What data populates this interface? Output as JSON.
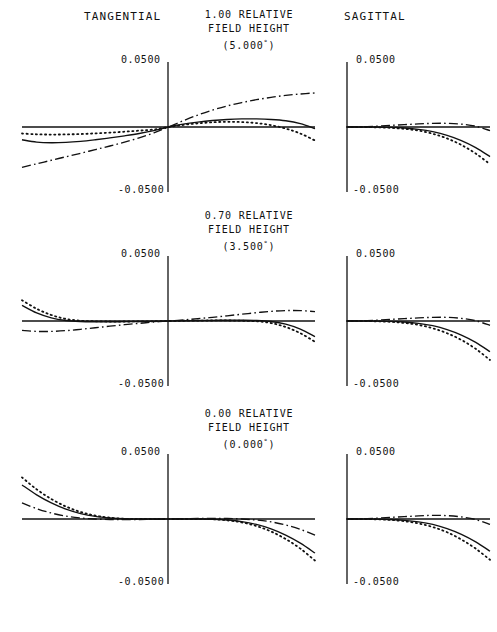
{
  "page": {
    "width": 497,
    "height": 632,
    "background": "#ffffff",
    "ink": "#111111"
  },
  "columns": {
    "tangential_label": "TANGENTIAL",
    "sagittal_label": "SAGITTAL"
  },
  "rows": [
    {
      "id": "row-1p00",
      "relative_field": "1.00 RELATIVE",
      "field_height_label": "FIELD HEIGHT",
      "angle": "(5.000",
      "angle_unit": "°",
      "angle_close": ")",
      "top_tick": "0.0500",
      "bottom_tick": "-0.0500"
    },
    {
      "id": "row-0p70",
      "relative_field": "0.70 RELATIVE",
      "field_height_label": "FIELD HEIGHT",
      "angle": "(3.500",
      "angle_unit": "°",
      "angle_close": ")",
      "top_tick": "0.0500",
      "bottom_tick": "-0.0500"
    },
    {
      "id": "row-0p00",
      "relative_field": "0.00 RELATIVE",
      "field_height_label": "FIELD HEIGHT",
      "angle": "(0.000",
      "angle_unit": "°",
      "angle_close": ")",
      "top_tick": "0.0500",
      "bottom_tick": "-0.0500"
    }
  ],
  "chart_data": {
    "type": "line",
    "xlabel": "Normalized pupil coordinate",
    "ylabel": "Transverse ray aberration (mm)",
    "ylim": [
      -0.05,
      0.05
    ],
    "ytick_labels": [
      "0.0500",
      "-0.0500"
    ],
    "grid": false,
    "legend_position": "none",
    "line_styles": {
      "solid": "wavelength-1",
      "dotted": "wavelength-2",
      "dashdot": "wavelength-3"
    },
    "panels": [
      {
        "panel": "tangential-1.00",
        "field": "1.00 RELATIVE FIELD HEIGHT (5.000°)",
        "fan": "tangential",
        "xlim": [
          -1,
          1
        ],
        "x": [
          -1.0,
          -0.9,
          -0.8,
          -0.7,
          -0.6,
          -0.5,
          -0.4,
          -0.3,
          -0.2,
          -0.1,
          0.0,
          0.1,
          0.2,
          0.3,
          0.4,
          0.5,
          0.6,
          0.7,
          0.8,
          0.9,
          1.0
        ],
        "series": [
          {
            "name": "wavelength-1",
            "style": "solid",
            "values": [
              -0.0098,
              -0.0116,
              -0.0121,
              -0.0118,
              -0.011,
              -0.0098,
              -0.0084,
              -0.0068,
              -0.005,
              -0.0028,
              0.0,
              0.0022,
              0.0038,
              0.005,
              0.0058,
              0.0062,
              0.0062,
              0.0058,
              0.0048,
              0.0026,
              -0.0012
            ]
          },
          {
            "name": "wavelength-2",
            "style": "dotted",
            "values": [
              -0.005,
              -0.0056,
              -0.0058,
              -0.0057,
              -0.0054,
              -0.0049,
              -0.0043,
              -0.0036,
              -0.0028,
              -0.0019,
              0.0,
              0.0016,
              0.0028,
              0.0036,
              0.004,
              0.0038,
              0.003,
              0.0014,
              -0.0012,
              -0.005,
              -0.0104
            ]
          },
          {
            "name": "wavelength-3",
            "style": "dashdot",
            "values": [
              -0.031,
              -0.0283,
              -0.0256,
              -0.0229,
              -0.0202,
              -0.0174,
              -0.0146,
              -0.0116,
              -0.0083,
              -0.0045,
              0.0,
              0.0048,
              0.0092,
              0.013,
              0.0162,
              0.0188,
              0.021,
              0.0228,
              0.0243,
              0.0254,
              0.0262
            ]
          }
        ]
      },
      {
        "panel": "sagittal-1.00",
        "field": "1.00 RELATIVE FIELD HEIGHT (5.000°)",
        "fan": "sagittal",
        "xlim": [
          0,
          1
        ],
        "x": [
          0.0,
          0.1,
          0.2,
          0.3,
          0.4,
          0.5,
          0.6,
          0.7,
          0.8,
          0.9,
          1.0
        ],
        "series": [
          {
            "name": "wavelength-1",
            "style": "solid",
            "values": [
              0.0,
              0.0,
              -0.0001,
              -0.0003,
              -0.0008,
              -0.0018,
              -0.0036,
              -0.0064,
              -0.0104,
              -0.0158,
              -0.0228
            ]
          },
          {
            "name": "wavelength-2",
            "style": "dotted",
            "values": [
              0.0,
              0.0,
              -0.0002,
              -0.0006,
              -0.0014,
              -0.0028,
              -0.0052,
              -0.0088,
              -0.0138,
              -0.0204,
              -0.0286
            ]
          },
          {
            "name": "wavelength-3",
            "style": "dashdot",
            "values": [
              0.0,
              0.0002,
              0.0006,
              0.0012,
              0.0018,
              0.0024,
              0.0028,
              0.0028,
              0.0022,
              0.0006,
              -0.0028
            ]
          }
        ]
      },
      {
        "panel": "tangential-0.70",
        "field": "0.70 RELATIVE FIELD HEIGHT (3.500°)",
        "fan": "tangential",
        "xlim": [
          -1,
          1
        ],
        "x": [
          -1.0,
          -0.9,
          -0.8,
          -0.7,
          -0.6,
          -0.5,
          -0.4,
          -0.3,
          -0.2,
          -0.1,
          0.0,
          0.1,
          0.2,
          0.3,
          0.4,
          0.5,
          0.6,
          0.7,
          0.8,
          0.9,
          1.0
        ],
        "series": [
          {
            "name": "wavelength-1",
            "style": "solid",
            "values": [
              0.012,
              0.0062,
              0.0024,
              0.0004,
              -0.0004,
              -0.0006,
              -0.0006,
              -0.0005,
              -0.0004,
              -0.0002,
              0.0,
              0.0002,
              0.0004,
              0.0005,
              0.0006,
              0.0006,
              0.0004,
              -0.0004,
              -0.0024,
              -0.0062,
              -0.012
            ]
          },
          {
            "name": "wavelength-2",
            "style": "dotted",
            "values": [
              0.016,
              0.0094,
              0.0046,
              0.0016,
              0.0002,
              -0.0002,
              -0.0004,
              -0.0004,
              -0.0003,
              -0.0002,
              0.0,
              0.0002,
              0.0003,
              0.0004,
              0.0004,
              0.0002,
              -0.0002,
              -0.0016,
              -0.0046,
              -0.0094,
              -0.016
            ]
          },
          {
            "name": "wavelength-3",
            "style": "dashdot",
            "values": [
              -0.0072,
              -0.008,
              -0.008,
              -0.0074,
              -0.0064,
              -0.0052,
              -0.004,
              -0.0028,
              -0.0018,
              -0.0008,
              0.0,
              0.0008,
              0.0018,
              0.0028,
              0.004,
              0.0052,
              0.0064,
              0.0074,
              0.008,
              0.008,
              0.0072
            ]
          }
        ]
      },
      {
        "panel": "sagittal-0.70",
        "field": "0.70 RELATIVE FIELD HEIGHT (3.500°)",
        "fan": "sagittal",
        "xlim": [
          0,
          1
        ],
        "x": [
          0.0,
          0.1,
          0.2,
          0.3,
          0.4,
          0.5,
          0.6,
          0.7,
          0.8,
          0.9,
          1.0
        ],
        "series": [
          {
            "name": "wavelength-1",
            "style": "solid",
            "values": [
              0.0,
              0.0,
              -0.0001,
              -0.0003,
              -0.0008,
              -0.0018,
              -0.0036,
              -0.0066,
              -0.0108,
              -0.0164,
              -0.0236
            ]
          },
          {
            "name": "wavelength-2",
            "style": "dotted",
            "values": [
              0.0,
              0.0,
              -0.0002,
              -0.0006,
              -0.0015,
              -0.003,
              -0.0056,
              -0.0094,
              -0.0146,
              -0.0214,
              -0.03
            ]
          },
          {
            "name": "wavelength-3",
            "style": "dashdot",
            "values": [
              0.0,
              0.0002,
              0.0006,
              0.0012,
              0.0018,
              0.0024,
              0.0028,
              0.0028,
              0.002,
              0.0002,
              -0.0034
            ]
          }
        ]
      },
      {
        "panel": "tangential-0.00",
        "field": "0.00 RELATIVE FIELD HEIGHT (0.000°)",
        "fan": "tangential",
        "xlim": [
          -1,
          1
        ],
        "x": [
          -1.0,
          -0.9,
          -0.8,
          -0.7,
          -0.6,
          -0.5,
          -0.4,
          -0.3,
          -0.2,
          -0.1,
          0.0,
          0.1,
          0.2,
          0.3,
          0.4,
          0.5,
          0.6,
          0.7,
          0.8,
          0.9,
          1.0
        ],
        "series": [
          {
            "name": "wavelength-1",
            "style": "solid",
            "values": [
              0.0262,
              0.0186,
              0.0124,
              0.0076,
              0.0042,
              0.002,
              0.0008,
              0.0002,
              0.0,
              0.0,
              0.0,
              0.0,
              0.0,
              -0.0002,
              -0.0008,
              -0.002,
              -0.0042,
              -0.0076,
              -0.0124,
              -0.0186,
              -0.0262
            ]
          },
          {
            "name": "wavelength-2",
            "style": "dotted",
            "values": [
              0.032,
              0.0228,
              0.0154,
              0.0096,
              0.0054,
              0.0026,
              0.001,
              0.0002,
              0.0,
              0.0,
              0.0,
              0.0,
              0.0,
              -0.0002,
              -0.001,
              -0.0026,
              -0.0054,
              -0.0096,
              -0.0154,
              -0.0228,
              -0.032
            ]
          },
          {
            "name": "wavelength-3",
            "style": "dashdot",
            "values": [
              0.0124,
              0.008,
              0.0046,
              0.0022,
              0.0008,
              0.0,
              -0.0004,
              -0.0005,
              -0.0004,
              -0.0002,
              0.0,
              0.0002,
              0.0004,
              0.0005,
              0.0004,
              0.0,
              -0.0008,
              -0.0022,
              -0.0046,
              -0.008,
              -0.0124
            ]
          }
        ]
      },
      {
        "panel": "sagittal-0.00",
        "field": "0.00 RELATIVE FIELD HEIGHT (0.000°)",
        "fan": "sagittal",
        "xlim": [
          0,
          1
        ],
        "x": [
          0.0,
          0.1,
          0.2,
          0.3,
          0.4,
          0.5,
          0.6,
          0.7,
          0.8,
          0.9,
          1.0
        ],
        "series": [
          {
            "name": "wavelength-1",
            "style": "solid",
            "values": [
              0.0,
              0.0,
              -0.0001,
              -0.0004,
              -0.001,
              -0.0022,
              -0.0042,
              -0.0074,
              -0.0118,
              -0.0176,
              -0.0248
            ]
          },
          {
            "name": "wavelength-2",
            "style": "dotted",
            "values": [
              0.0,
              0.0,
              -0.0002,
              -0.0007,
              -0.0017,
              -0.0034,
              -0.0062,
              -0.0102,
              -0.0158,
              -0.0228,
              -0.0314
            ]
          },
          {
            "name": "wavelength-3",
            "style": "dashdot",
            "values": [
              0.0,
              0.0002,
              0.0006,
              0.0012,
              0.0018,
              0.0024,
              0.0028,
              0.0026,
              0.0016,
              -0.0004,
              -0.0042
            ]
          }
        ]
      }
    ]
  }
}
